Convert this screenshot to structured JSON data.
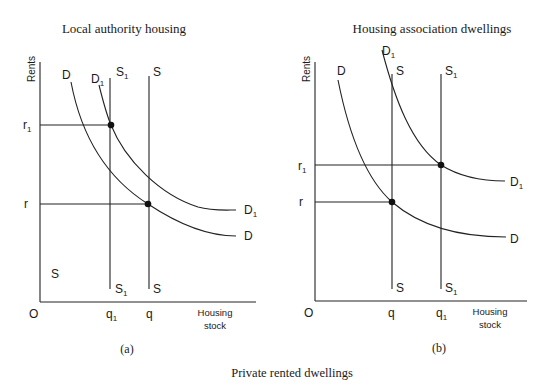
{
  "caption": "Private rented dwellings",
  "panels": [
    {
      "id": "a",
      "title": "Local authority housing",
      "sublabel": "(a)",
      "y_axis_label": "Rents",
      "x_axis_label_line1": "Housing",
      "x_axis_label_line2": "stock",
      "origin": "O",
      "price_labels": {
        "upper": "r",
        "upper_sub": "1",
        "lower": "r"
      },
      "qty_labels": {
        "left": "q",
        "left_sub": "1",
        "right": "q",
        "right_sub": ""
      },
      "curve_labels": {
        "D_top": "D",
        "D1_top": "D",
        "D1_top_sub": "1",
        "S1_top": "S",
        "S1_top_sub": "1",
        "S_top": "S",
        "D1_end": "D",
        "D1_end_sub": "1",
        "D_end": "D",
        "S1_bottom": "S",
        "S1_bottom_sub": "1",
        "S_bottom": "S",
        "stray_S": "S"
      }
    },
    {
      "id": "b",
      "title": "Housing association dwellings",
      "sublabel": "(b)",
      "y_axis_label": "Rents",
      "x_axis_label_line1": "Housing",
      "x_axis_label_line2": "stock",
      "origin": "O",
      "price_labels": {
        "upper": "r",
        "upper_sub": "1",
        "lower": "r"
      },
      "qty_labels": {
        "left": "q",
        "left_sub": "",
        "right": "q",
        "right_sub": "1"
      },
      "curve_labels": {
        "D_top": "D",
        "D1_top": "D",
        "D1_top_sub": "1",
        "S_top": "S",
        "S1_top": "S",
        "S1_top_sub": "1",
        "D1_end": "D",
        "D1_end_sub": "1",
        "D_end": "D",
        "S_bottom": "S",
        "S1_bottom": "S",
        "S1_bottom_sub": "1"
      }
    }
  ]
}
